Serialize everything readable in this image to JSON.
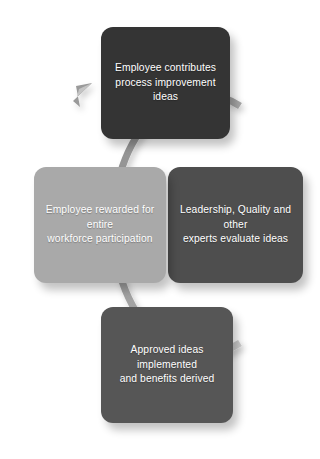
{
  "diagram": {
    "type": "cycle",
    "background_color": "#ffffff",
    "ring": {
      "color": "#9a9a9a",
      "highlight_color": "#c9c9c9",
      "shadow_color": "#d4d4d4",
      "direction": "clockwise",
      "arrowhead_position": "top-left"
    },
    "nodes": [
      {
        "id": "contribute",
        "position": "top",
        "label": "Employee contributes\nprocess improvement ideas",
        "fill_color": "#343434",
        "text_color": "#ffffff",
        "order": 1
      },
      {
        "id": "evaluate",
        "position": "right",
        "label": "Leadership, Quality and other\nexperts evaluate ideas",
        "fill_color": "#4e4e4e",
        "text_color": "#ffffff",
        "order": 2
      },
      {
        "id": "implement",
        "position": "bottom",
        "label": "Approved ideas implemented\nand benefits derived",
        "fill_color": "#565656",
        "text_color": "#ffffff",
        "order": 3
      },
      {
        "id": "reward",
        "position": "left",
        "label": "Employee rewarded for entire\nworkforce participation",
        "fill_color": "#a9a9a9",
        "text_color": "#ffffff",
        "order": 4
      }
    ]
  }
}
